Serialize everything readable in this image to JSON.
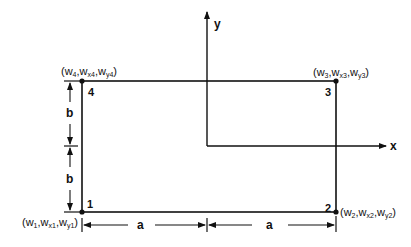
{
  "diagram": {
    "type": "rectangular plate element with corner nodes",
    "axes": {
      "x_label": "x",
      "y_label": "y"
    },
    "nodes": [
      {
        "id": "1",
        "dofs": [
          "w",
          "x",
          "y"
        ],
        "label_parts": [
          "(w",
          "1",
          ",w",
          "x1",
          ",w",
          "y1",
          ")"
        ]
      },
      {
        "id": "2",
        "dofs": [
          "w",
          "x",
          "y"
        ],
        "label_parts": [
          "(w",
          "2",
          ",w",
          "x2",
          ",w",
          "y2",
          ")"
        ]
      },
      {
        "id": "3",
        "dofs": [
          "w",
          "x",
          "y"
        ],
        "label_parts": [
          "(w",
          "3",
          ",w",
          "x3",
          ",w",
          "y3",
          ")"
        ]
      },
      {
        "id": "4",
        "dofs": [
          "w",
          "x",
          "y"
        ],
        "label_parts": [
          "(w",
          "4",
          ",w",
          "x4",
          ",w",
          "y4",
          ")"
        ]
      }
    ],
    "dimensions": {
      "horizontal": [
        "a",
        "a"
      ],
      "vertical": [
        "b",
        "b"
      ]
    }
  }
}
